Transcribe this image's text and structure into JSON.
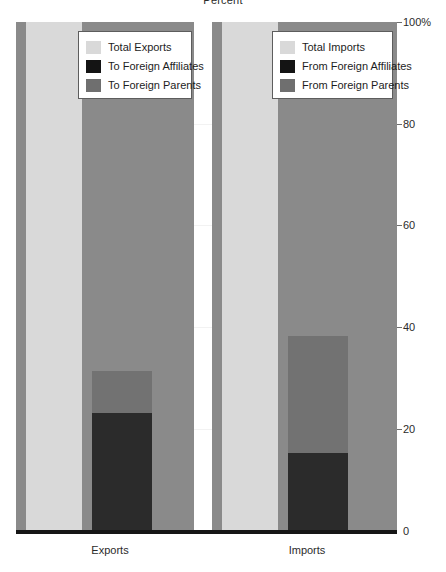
{
  "figure": {
    "title_fragment": "Percent",
    "axis": {
      "y_unit_label": "100%",
      "ticks": [
        {
          "label": "100%",
          "value": 100
        },
        {
          "label": "80",
          "value": 80
        },
        {
          "label": "60",
          "value": 60
        },
        {
          "label": "40",
          "value": 40
        },
        {
          "label": "20",
          "value": 20
        },
        {
          "label": "0",
          "value": 0
        }
      ]
    },
    "colors": {
      "total": "#d9d9d9",
      "affiliates": "#2b2b2b",
      "parents": "#727272",
      "panel_background": "#8a8a8a",
      "baseline": "#161616",
      "gridline": "#f2f2f2"
    },
    "panels": [
      {
        "x_label": "Exports",
        "legend": {
          "items": [
            {
              "label": "Total Exports",
              "swatch": "total"
            },
            {
              "label": "To Foreign Affiliates",
              "swatch": "affiliates"
            },
            {
              "label": "To Foreign Parents",
              "swatch": "parents"
            }
          ]
        }
      },
      {
        "x_label": "Imports",
        "legend": {
          "items": [
            {
              "label": "Total Imports",
              "swatch": "total"
            },
            {
              "label": "From Foreign Affiliates",
              "swatch": "affiliates"
            },
            {
              "label": "From Foreign Parents",
              "swatch": "parents"
            }
          ]
        }
      }
    ]
  },
  "chart_data": {
    "type": "bar",
    "title": "Percent",
    "xlabel": "",
    "ylabel": "Percent",
    "ylim": [
      0,
      100
    ],
    "yticks": [
      0,
      20,
      40,
      60,
      80,
      100
    ],
    "ytick_labels": [
      "0",
      "20",
      "40",
      "60",
      "80",
      "100%"
    ],
    "grid": true,
    "legend_position": "inside-top",
    "categories": [
      "Exports",
      "Imports"
    ],
    "series": [
      {
        "name": "Total",
        "values": [
          100,
          100
        ]
      },
      {
        "name": "To/From Foreign Parents",
        "values": [
          31.5,
          38.3
        ]
      },
      {
        "name": "To/From Foreign Affiliates",
        "values": [
          23.2,
          15.3
        ]
      }
    ],
    "panels": [
      {
        "category": "Exports",
        "bars": [
          {
            "name": "Total Exports",
            "value": 100
          },
          {
            "name": "To Foreign Parents",
            "value": 31.5
          },
          {
            "name": "To Foreign Affiliates",
            "value": 23.2
          }
        ]
      },
      {
        "category": "Imports",
        "bars": [
          {
            "name": "Total Imports",
            "value": 100
          },
          {
            "name": "From Foreign Parents",
            "value": 38.3
          },
          {
            "name": "From Foreign Affiliates",
            "value": 15.3
          }
        ]
      }
    ]
  }
}
